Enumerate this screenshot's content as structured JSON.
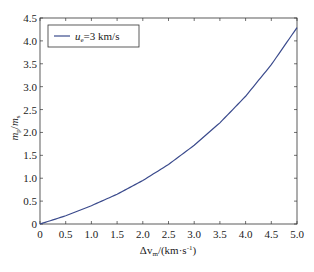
{
  "chart_data": {
    "type": "line",
    "title": "",
    "xlabel": "Δv_m/(km·s⁻¹)",
    "xlabel_parts": {
      "main": "Δv",
      "sub": "m",
      "unit": "/(km·s",
      "sup": "-1",
      "close": ")"
    },
    "ylabel": "m_p/m_s",
    "ylabel_parts": {
      "a": "m",
      "a_sub": "p",
      "sep": "/",
      "b": "m",
      "b_sub": "s"
    },
    "xlim": [
      0,
      5.0
    ],
    "ylim": [
      0,
      4.5
    ],
    "xticks": [
      "0",
      "0.5",
      "1.0",
      "1.5",
      "2.0",
      "2.5",
      "3.0",
      "3.5",
      "4.0",
      "4.5",
      "5.0"
    ],
    "yticks": [
      "0",
      "0.5",
      "1.0",
      "1.5",
      "2.0",
      "2.5",
      "3.0",
      "3.5",
      "4.0",
      "4.5"
    ],
    "grid": false,
    "legend_position": "upper left",
    "series": [
      {
        "name": "u_e=3 km/s",
        "legend_parts": {
          "var": "u",
          "sub": "e",
          "rest": "=3 km/s"
        },
        "color": "#3a4a8c",
        "x": [
          0,
          0.5,
          1.0,
          1.5,
          2.0,
          2.5,
          3.0,
          3.5,
          4.0,
          4.5,
          5.0
        ],
        "values": [
          0,
          0.18,
          0.4,
          0.65,
          0.95,
          1.3,
          1.72,
          2.21,
          2.79,
          3.48,
          4.29
        ]
      }
    ]
  }
}
